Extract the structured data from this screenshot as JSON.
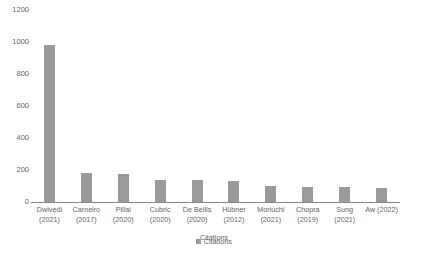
{
  "chart_data": {
    "type": "bar",
    "title": "",
    "xlabel": "Citations",
    "ylabel": "",
    "categories": [
      "Dwivedi (2021)",
      "Carneiro (2017)",
      "Pillai (2020)",
      "Cubric (2020)",
      "De Bellis (2020)",
      "Hübner (2012)",
      "Moriuchi (2021)",
      "Chopra (2019)",
      "Sung (2021)",
      "Aw (2022)"
    ],
    "category_lines": [
      [
        "Dwivedi",
        "(2021)"
      ],
      [
        "Carneiro",
        "(2017)"
      ],
      [
        "Pillai",
        "(2020)"
      ],
      [
        "Cubric",
        "(2020)"
      ],
      [
        "De Bellis",
        "(2020)"
      ],
      [
        "Hübner",
        "(2012)"
      ],
      [
        "Moriuchi",
        "(2021)"
      ],
      [
        "Chopra",
        "(2019)"
      ],
      [
        "Sung",
        "(2021)"
      ],
      [
        "Aw (2022)",
        ""
      ]
    ],
    "series": [
      {
        "name": "Citations",
        "color": "#9a9a9a",
        "values": [
          980,
          180,
          175,
          138,
          135,
          130,
          100,
          93,
          92,
          88
        ]
      }
    ],
    "ylim": [
      0,
      1200
    ],
    "yticks": [
      0,
      200,
      400,
      600,
      800,
      1000,
      1200
    ],
    "ytick_labels": [
      "0",
      "200",
      "400",
      "600",
      "800",
      "1000",
      "1200"
    ],
    "grid": false,
    "legend": {
      "position": "bottom",
      "entries": [
        {
          "label": "Citations",
          "color": "#9a9a9a",
          "marker": "square-marker"
        }
      ]
    }
  }
}
